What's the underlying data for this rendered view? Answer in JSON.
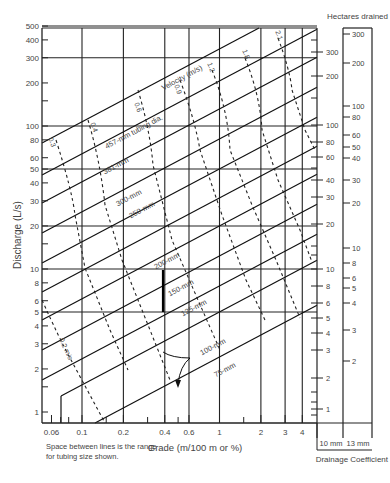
{
  "chart_data": {
    "type": "line",
    "xlabel": "Grade (m/100 m or %)",
    "ylabel": "Discharge (L/s)",
    "x_scale": "log",
    "y_scale": "log",
    "xlim": [
      0.05,
      4.3
    ],
    "ylim": [
      0.8,
      500
    ],
    "x_ticks": [
      {
        "v": 0.06,
        "label": "0.06"
      },
      {
        "v": 0.1,
        "label": "0.1"
      },
      {
        "v": 0.2,
        "label": "0.2"
      },
      {
        "v": 0.4,
        "label": "0.4"
      },
      {
        "v": 0.6,
        "label": "0.6"
      },
      {
        "v": 1,
        "label": "1"
      },
      {
        "v": 2,
        "label": "2"
      },
      {
        "v": 3,
        "label": "3"
      },
      {
        "v": 4,
        "label": "4"
      }
    ],
    "x_minor_ticks": [
      0.07,
      0.08,
      0.15,
      0.3,
      0.5,
      1.5
    ],
    "x_grid": [
      0.1,
      0.2,
      0.4,
      0.6,
      1,
      2,
      3,
      4
    ],
    "y_ticks": [
      {
        "v": 500,
        "label": "500"
      },
      {
        "v": 400,
        "label": "400"
      },
      {
        "v": 300,
        "label": "300"
      },
      {
        "v": 200,
        "label": "200"
      },
      {
        "v": 100,
        "label": "100"
      },
      {
        "v": 80,
        "label": "80"
      },
      {
        "v": 60,
        "label": "60"
      },
      {
        "v": 50,
        "label": "50"
      },
      {
        "v": 40,
        "label": "40"
      },
      {
        "v": 30,
        "label": "30"
      },
      {
        "v": 20,
        "label": "20"
      },
      {
        "v": 10,
        "label": "10"
      },
      {
        "v": 8,
        "label": "8"
      },
      {
        "v": 6,
        "label": "6"
      },
      {
        "v": 5,
        "label": "5"
      },
      {
        "v": 4,
        "label": "4"
      },
      {
        "v": 3,
        "label": "3"
      },
      {
        "v": 2,
        "label": "2"
      },
      {
        "v": 1,
        "label": "1"
      }
    ],
    "y_minor_ticks": [
      150,
      15,
      1.5
    ],
    "y_grid": [
      500,
      300,
      100,
      50,
      20,
      10,
      5
    ],
    "tubing_lines": [
      {
        "name": "457-mm tubing dia.",
        "label_at": [
          0.18,
          72
        ]
      },
      {
        "name": "381-mm",
        "label_at": [
          0.2,
          38
        ]
      },
      {
        "name": "300-mm",
        "label_at": [
          0.2,
          21
        ]
      },
      {
        "name": "250-mm",
        "label_at": [
          0.25,
          16.5
        ]
      },
      {
        "name": "200-mm",
        "label_at": [
          0.55,
          10.5
        ]
      },
      {
        "name": "150-mm",
        "label_at": [
          0.75,
          6.3
        ]
      },
      {
        "name": "125-mm",
        "label_at": [
          0.9,
          4.6
        ]
      },
      {
        "name": "100-mm",
        "label_at": [
          1.3,
          2.55
        ]
      },
      {
        "name": "75-mm",
        "label_at": [
          1.3,
          1.6
        ]
      }
    ],
    "velocity_lines_mps": [
      "0.2 m/s",
      "0.3",
      "0.4",
      "0.6",
      "0.9",
      "1.2",
      "1.8",
      "2.1"
    ],
    "velocity_title": "Velocity (m/s)",
    "example": {
      "grade": 0.4,
      "discharge": 5,
      "result": "150-mm"
    },
    "right_scales": {
      "title": "Hectares drained",
      "footer": "Drainage Coefficient",
      "scale_10mm": {
        "label": "10 mm",
        "ticks": [
          "300",
          "200",
          "100",
          "80",
          "60",
          "40",
          "30",
          "20",
          "10",
          "8",
          "6",
          "5",
          "4",
          "3",
          "2",
          "1"
        ]
      },
      "scale_13mm": {
        "label": "13 mm",
        "ticks": [
          "300",
          "200",
          "100",
          "80",
          "60",
          "50",
          "40",
          "30",
          "20",
          "10",
          "8",
          "6",
          "5",
          "4",
          "3",
          "2",
          "1"
        ]
      }
    },
    "legend": "none",
    "grid": true
  },
  "labels": {
    "ylabel": "Discharge (L/s)",
    "xlabel": "Grade (m/100 m or %)",
    "hectares": "Hectares drained",
    "coef": "Drainage Coefficient",
    "mm10": "10 mm",
    "mm13": "13 mm",
    "velocity": "Velocity (m/s)",
    "note_line1": "Space between lines is the range",
    "note_line2": "for tubing size shown."
  }
}
